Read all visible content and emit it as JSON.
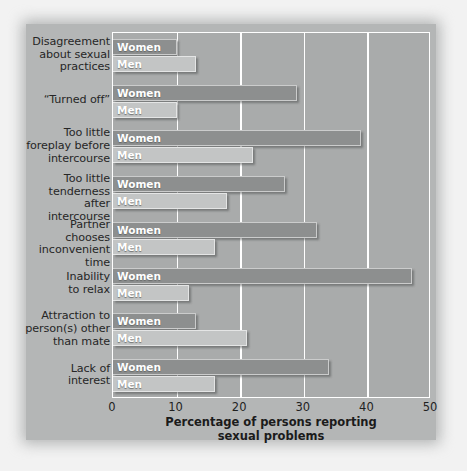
{
  "chart_data": {
    "type": "bar",
    "orientation": "horizontal",
    "title": "",
    "xlabel": "Percentage of persons reporting sexual problems",
    "ylabel": "",
    "xlim": [
      0,
      50
    ],
    "xticks": [
      0,
      10,
      20,
      30,
      40,
      50
    ],
    "grid": true,
    "legend_position": "in-bar",
    "categories": [
      "Disagreement about sexual practices",
      "“Turned off”",
      "Too little foreplay before intercourse",
      "Too little tenderness after intercourse",
      "Partner chooses inconvenient time",
      "Inability to relax",
      "Attraction to person(s) other than mate",
      "Lack of interest"
    ],
    "category_lines": [
      [
        "Disagreement",
        "about sexual",
        "practices"
      ],
      [
        "“Turned off”"
      ],
      [
        "Too little",
        "foreplay before",
        "intercourse"
      ],
      [
        "Too little",
        "tenderness",
        "after intercourse"
      ],
      [
        "Partner chooses",
        "inconvenient",
        "time"
      ],
      [
        "Inability",
        "to relax"
      ],
      [
        "Attraction to",
        "person(s) other",
        "than mate"
      ],
      [
        "Lack of",
        "interest"
      ]
    ],
    "series": [
      {
        "name": "Women",
        "color": "#8d8f8f",
        "values": [
          10,
          29,
          39,
          27,
          32,
          47,
          13,
          34
        ]
      },
      {
        "name": "Men",
        "color": "#c3c5c5",
        "values": [
          13,
          10,
          22,
          18,
          16,
          12,
          21,
          16
        ]
      }
    ]
  },
  "axis": {
    "tick_labels": [
      "0",
      "10",
      "20",
      "30",
      "40",
      "50"
    ],
    "title_line1": "Percentage of persons reporting",
    "title_line2": "sexual problems"
  },
  "colors": {
    "page_background": "#f2f2f2",
    "card_background": "#b4b6b6",
    "plot_background": "#a9abab",
    "gridline": "#ffffff",
    "women_bar": "#8d8f8f",
    "men_bar": "#c3c5c5",
    "label_text": "#262626",
    "bar_key_text": "#ffffff"
  }
}
